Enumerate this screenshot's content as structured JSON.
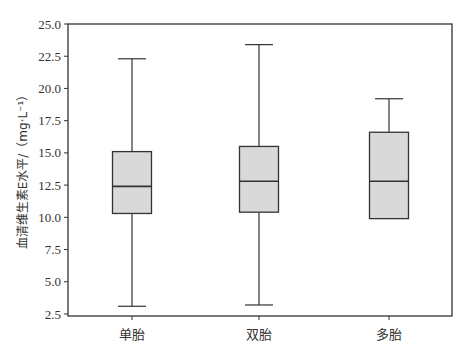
{
  "chart_data": {
    "type": "box",
    "title": "",
    "xlabel": "",
    "ylabel": "血清维生素E水平/（mg·L⁻¹）",
    "ylim": [
      2.5,
      25.0
    ],
    "yticks": [
      2.5,
      5.0,
      7.5,
      10.0,
      12.5,
      15.0,
      17.5,
      20.0,
      22.5,
      25.0
    ],
    "ytick_labels": [
      "2.5",
      "5.0",
      "7.5",
      "10.0",
      "12.5",
      "15.0",
      "17.5",
      "20.0",
      "22.5",
      "25.0"
    ],
    "categories": [
      "单胎",
      "双胎",
      "多胎"
    ],
    "grid": false,
    "legend": null,
    "series": [
      {
        "name": "单胎",
        "whisker_low": 3.1,
        "q1": 10.3,
        "median": 12.4,
        "q3": 15.1,
        "whisker_high": 22.3
      },
      {
        "name": "双胎",
        "whisker_low": 3.2,
        "q1": 10.4,
        "median": 12.8,
        "q3": 15.5,
        "whisker_high": 23.4
      },
      {
        "name": "多胎",
        "whisker_low": 9.9,
        "q1": 9.9,
        "median": 12.8,
        "q3": 16.6,
        "whisker_high": 19.2
      }
    ],
    "colors": {
      "box_fill": "#d9d9d9",
      "line": "#333333"
    }
  }
}
